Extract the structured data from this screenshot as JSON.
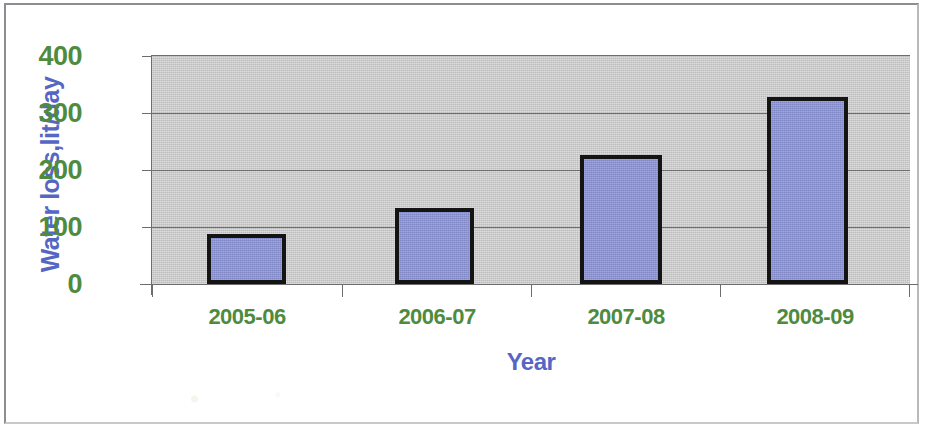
{
  "figure": {
    "background_color": "#ffffff",
    "border_color": "#8e8e92",
    "plot_background_color": "#c9c9c9",
    "gridline_color": "#6e6e6e",
    "bar_fill_color": "#8b94d6",
    "bar_border_color": "#141414",
    "tick_label_color": "#4e8b3f",
    "axis_title_color": "#5566c4"
  },
  "chart_data": {
    "type": "bar",
    "title": "",
    "subtitle": "",
    "xlabel": "Year",
    "ylabel": "Water loss,lit/day",
    "categories": [
      "2005-06",
      "2006-07",
      "2007-08",
      "2008-09"
    ],
    "values": [
      88,
      133,
      227,
      328
    ],
    "series": [
      {
        "name": "Water loss",
        "values": [
          88,
          133,
          227,
          328
        ]
      }
    ],
    "ylim": [
      0,
      400
    ],
    "ytick_labels": [
      "400",
      "300",
      "200",
      "100",
      "0"
    ],
    "yticks": [
      400,
      300,
      200,
      100,
      0
    ],
    "ytick_interval": 100,
    "grid": true,
    "grid_axis": "y",
    "legend": false,
    "legend_position": "none",
    "annotations": [],
    "data_labels": false
  }
}
